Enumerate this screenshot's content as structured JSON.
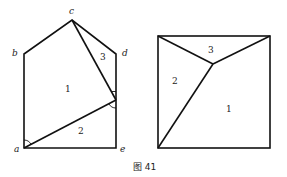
{
  "caption": "图 41",
  "left_figure": {
    "vertex_labels": {
      "a": "a",
      "b": "b",
      "c": "c",
      "d": "d",
      "e": "e"
    },
    "region_labels": {
      "r1": "1",
      "r2": "2",
      "r3": "3"
    }
  },
  "right_figure": {
    "region_labels": {
      "r1": "1",
      "r2": "2",
      "r3": "3"
    }
  },
  "colors": {
    "stroke": "#111111",
    "background": "#ffffff"
  }
}
